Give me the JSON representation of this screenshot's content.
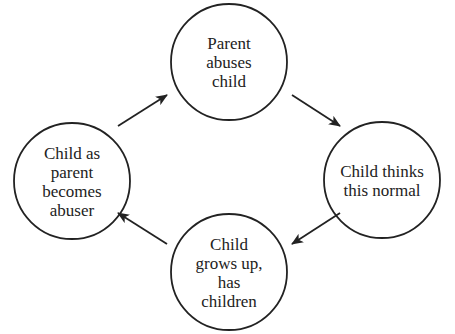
{
  "diagram": {
    "type": "cycle",
    "colors": {
      "stroke": "#222222",
      "text": "#222222",
      "background": "#ffffff"
    },
    "nodes": [
      {
        "id": "parent-abuses-child",
        "lines": [
          "Parent",
          "abuses",
          "child"
        ],
        "cx": 229,
        "cy": 62,
        "r": 58
      },
      {
        "id": "child-thinks-normal",
        "lines": [
          "Child thinks",
          "this normal"
        ],
        "cx": 382,
        "cy": 180,
        "r": 58
      },
      {
        "id": "child-grows-up",
        "lines": [
          "Child",
          "grows up,",
          "has",
          "children"
        ],
        "cx": 229,
        "cy": 272,
        "r": 58
      },
      {
        "id": "child-becomes-abuser",
        "lines": [
          "Child as",
          "parent",
          "becomes",
          "abuser"
        ],
        "cx": 72,
        "cy": 181,
        "r": 58
      }
    ],
    "edges": [
      {
        "from": "parent-abuses-child",
        "to": "child-thinks-normal",
        "x1": 292,
        "y1": 95,
        "x2": 340,
        "y2": 126
      },
      {
        "from": "child-thinks-normal",
        "to": "child-grows-up",
        "x1": 340,
        "y1": 213,
        "x2": 292,
        "y2": 244
      },
      {
        "from": "child-grows-up",
        "to": "child-becomes-abuser",
        "x1": 167,
        "y1": 244,
        "x2": 118,
        "y2": 213
      },
      {
        "from": "child-becomes-abuser",
        "to": "parent-abuses-child",
        "x1": 118,
        "y1": 126,
        "x2": 167,
        "y2": 95
      }
    ]
  }
}
